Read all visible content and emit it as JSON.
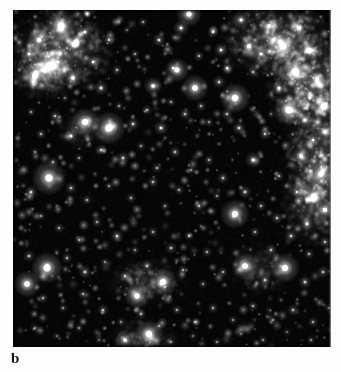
{
  "figure": {
    "panel_label": "b",
    "caption_text": "",
    "image_kind": "darkfield-fluorescence-micrograph",
    "colors": {
      "background": "#ffffff",
      "field_background": "#050505",
      "particle_bright": "#ffffff",
      "particle_mid": "#c8c8c8",
      "particle_dim": "#6e6e6e",
      "haze": "#9a9a9a",
      "label_color": "#161616"
    },
    "field": {
      "x": 13,
      "y": 10,
      "width": 318,
      "height": 337
    }
  },
  "chart_data": {
    "type": "scatter",
    "title": "",
    "subtitle": "",
    "xlabel": "",
    "ylabel": "",
    "grid": false,
    "legend": null,
    "background": "#050505",
    "xlim": [
      0,
      318
    ],
    "ylim": [
      0,
      337
    ],
    "haze_clusters": [
      {
        "cx": 48,
        "cy": 40,
        "rx": 56,
        "ry": 44,
        "intensity": 0.42
      },
      {
        "cx": 30,
        "cy": 62,
        "rx": 34,
        "ry": 30,
        "intensity": 0.3
      },
      {
        "cx": 262,
        "cy": 30,
        "rx": 60,
        "ry": 42,
        "intensity": 0.4
      },
      {
        "cx": 300,
        "cy": 78,
        "rx": 48,
        "ry": 58,
        "intensity": 0.46
      },
      {
        "cx": 308,
        "cy": 150,
        "rx": 42,
        "ry": 60,
        "intensity": 0.4
      },
      {
        "cx": 300,
        "cy": 196,
        "rx": 34,
        "ry": 44,
        "intensity": 0.28
      },
      {
        "cx": 132,
        "cy": 272,
        "rx": 40,
        "ry": 26,
        "intensity": 0.2
      },
      {
        "cx": 246,
        "cy": 258,
        "rx": 34,
        "ry": 28,
        "intensity": 0.16
      },
      {
        "cx": 130,
        "cy": 330,
        "rx": 36,
        "ry": 24,
        "intensity": 0.18
      },
      {
        "cx": 70,
        "cy": 120,
        "rx": 30,
        "ry": 22,
        "intensity": 0.14
      }
    ],
    "points": [
      {
        "x": 48,
        "y": 16,
        "r": 5.0,
        "i": 1.0
      },
      {
        "x": 26,
        "y": 30,
        "r": 3.6,
        "i": 0.8
      },
      {
        "x": 62,
        "y": 34,
        "r": 3.2,
        "i": 0.72
      },
      {
        "x": 38,
        "y": 56,
        "r": 5.6,
        "i": 0.96
      },
      {
        "x": 22,
        "y": 66,
        "r": 4.4,
        "i": 0.88
      },
      {
        "x": 60,
        "y": 68,
        "r": 3.0,
        "i": 0.7
      },
      {
        "x": 72,
        "y": 22,
        "r": 2.4,
        "i": 0.62
      },
      {
        "x": 16,
        "y": 44,
        "r": 2.6,
        "i": 0.6
      },
      {
        "x": 80,
        "y": 52,
        "r": 2.2,
        "i": 0.55
      },
      {
        "x": 96,
        "y": 30,
        "r": 2.0,
        "i": 0.5
      },
      {
        "x": 88,
        "y": 78,
        "r": 2.4,
        "i": 0.58
      },
      {
        "x": 104,
        "y": 60,
        "r": 1.8,
        "i": 0.46
      },
      {
        "x": 122,
        "y": 44,
        "r": 1.6,
        "i": 0.42
      },
      {
        "x": 130,
        "y": 12,
        "r": 1.6,
        "i": 0.4
      },
      {
        "x": 146,
        "y": 30,
        "r": 2.2,
        "i": 0.56
      },
      {
        "x": 140,
        "y": 76,
        "r": 3.0,
        "i": 0.74
      },
      {
        "x": 160,
        "y": 58,
        "r": 1.8,
        "i": 0.46
      },
      {
        "x": 168,
        "y": 18,
        "r": 2.6,
        "i": 0.64
      },
      {
        "x": 176,
        "y": 4,
        "r": 4.2,
        "i": 0.9
      },
      {
        "x": 186,
        "y": 46,
        "r": 1.8,
        "i": 0.44
      },
      {
        "x": 164,
        "y": 60,
        "r": 4.0,
        "i": 0.86
      },
      {
        "x": 182,
        "y": 78,
        "r": 4.4,
        "i": 0.92
      },
      {
        "x": 200,
        "y": 22,
        "r": 2.0,
        "i": 0.5
      },
      {
        "x": 208,
        "y": 40,
        "r": 2.4,
        "i": 0.58
      },
      {
        "x": 214,
        "y": 58,
        "r": 2.0,
        "i": 0.48
      },
      {
        "x": 228,
        "y": 10,
        "r": 2.8,
        "i": 0.66
      },
      {
        "x": 236,
        "y": 36,
        "r": 3.2,
        "i": 0.76
      },
      {
        "x": 206,
        "y": 72,
        "r": 2.2,
        "i": 0.52
      },
      {
        "x": 222,
        "y": 88,
        "r": 5.0,
        "i": 0.96
      },
      {
        "x": 240,
        "y": 62,
        "r": 1.8,
        "i": 0.46
      },
      {
        "x": 256,
        "y": 16,
        "r": 3.0,
        "i": 0.72
      },
      {
        "x": 248,
        "y": 44,
        "r": 2.6,
        "i": 0.64
      },
      {
        "x": 270,
        "y": 36,
        "r": 5.2,
        "i": 0.98
      },
      {
        "x": 286,
        "y": 18,
        "r": 3.0,
        "i": 0.76
      },
      {
        "x": 296,
        "y": 40,
        "r": 3.4,
        "i": 0.8
      },
      {
        "x": 282,
        "y": 62,
        "r": 5.4,
        "i": 0.98
      },
      {
        "x": 304,
        "y": 70,
        "r": 3.0,
        "i": 0.74
      },
      {
        "x": 266,
        "y": 78,
        "r": 2.4,
        "i": 0.58
      },
      {
        "x": 310,
        "y": 96,
        "r": 3.4,
        "i": 0.8
      },
      {
        "x": 292,
        "y": 110,
        "r": 2.6,
        "i": 0.64
      },
      {
        "x": 276,
        "y": 100,
        "r": 5.0,
        "i": 0.94
      },
      {
        "x": 300,
        "y": 130,
        "r": 2.2,
        "i": 0.54
      },
      {
        "x": 312,
        "y": 122,
        "r": 2.8,
        "i": 0.7
      },
      {
        "x": 288,
        "y": 146,
        "r": 3.0,
        "i": 0.72
      },
      {
        "x": 308,
        "y": 164,
        "r": 4.0,
        "i": 0.86
      },
      {
        "x": 300,
        "y": 186,
        "r": 3.2,
        "i": 0.76
      },
      {
        "x": 312,
        "y": 200,
        "r": 3.4,
        "i": 0.78
      },
      {
        "x": 284,
        "y": 182,
        "r": 2.0,
        "i": 0.5
      },
      {
        "x": 294,
        "y": 214,
        "r": 2.2,
        "i": 0.52
      },
      {
        "x": 266,
        "y": 166,
        "r": 1.8,
        "i": 0.44
      },
      {
        "x": 252,
        "y": 124,
        "r": 2.0,
        "i": 0.5
      },
      {
        "x": 240,
        "y": 150,
        "r": 2.6,
        "i": 0.62
      },
      {
        "x": 226,
        "y": 118,
        "r": 2.2,
        "i": 0.54
      },
      {
        "x": 214,
        "y": 104,
        "r": 2.0,
        "i": 0.48
      },
      {
        "x": 196,
        "y": 112,
        "r": 1.6,
        "i": 0.4
      },
      {
        "x": 188,
        "y": 96,
        "r": 1.8,
        "i": 0.44
      },
      {
        "x": 172,
        "y": 104,
        "r": 2.0,
        "i": 0.48
      },
      {
        "x": 158,
        "y": 92,
        "r": 1.6,
        "i": 0.4
      },
      {
        "x": 148,
        "y": 118,
        "r": 2.4,
        "i": 0.58
      },
      {
        "x": 134,
        "y": 100,
        "r": 1.8,
        "i": 0.44
      },
      {
        "x": 120,
        "y": 114,
        "r": 2.2,
        "i": 0.52
      },
      {
        "x": 106,
        "y": 96,
        "r": 1.6,
        "i": 0.4
      },
      {
        "x": 96,
        "y": 118,
        "r": 5.4,
        "i": 0.98
      },
      {
        "x": 72,
        "y": 112,
        "r": 4.6,
        "i": 0.92
      },
      {
        "x": 58,
        "y": 126,
        "r": 2.2,
        "i": 0.54
      },
      {
        "x": 42,
        "y": 106,
        "r": 2.0,
        "i": 0.48
      },
      {
        "x": 28,
        "y": 124,
        "r": 1.8,
        "i": 0.44
      },
      {
        "x": 18,
        "y": 102,
        "r": 1.6,
        "i": 0.4
      },
      {
        "x": 22,
        "y": 142,
        "r": 1.6,
        "i": 0.38
      },
      {
        "x": 40,
        "y": 152,
        "r": 1.8,
        "i": 0.44
      },
      {
        "x": 66,
        "y": 148,
        "r": 1.6,
        "i": 0.38
      },
      {
        "x": 88,
        "y": 140,
        "r": 1.8,
        "i": 0.44
      },
      {
        "x": 110,
        "y": 148,
        "r": 2.2,
        "i": 0.52
      },
      {
        "x": 128,
        "y": 136,
        "r": 1.6,
        "i": 0.38
      },
      {
        "x": 144,
        "y": 158,
        "r": 1.8,
        "i": 0.42
      },
      {
        "x": 162,
        "y": 142,
        "r": 2.0,
        "i": 0.48
      },
      {
        "x": 178,
        "y": 160,
        "r": 1.6,
        "i": 0.38
      },
      {
        "x": 196,
        "y": 150,
        "r": 1.8,
        "i": 0.42
      },
      {
        "x": 210,
        "y": 168,
        "r": 2.0,
        "i": 0.48
      },
      {
        "x": 232,
        "y": 182,
        "r": 2.2,
        "i": 0.54
      },
      {
        "x": 248,
        "y": 196,
        "r": 1.8,
        "i": 0.44
      },
      {
        "x": 264,
        "y": 208,
        "r": 2.0,
        "i": 0.48
      },
      {
        "x": 36,
        "y": 168,
        "r": 5.6,
        "i": 0.98
      },
      {
        "x": 58,
        "y": 178,
        "r": 2.0,
        "i": 0.48
      },
      {
        "x": 18,
        "y": 182,
        "r": 2.2,
        "i": 0.54
      },
      {
        "x": 74,
        "y": 190,
        "r": 1.8,
        "i": 0.42
      },
      {
        "x": 96,
        "y": 176,
        "r": 1.6,
        "i": 0.38
      },
      {
        "x": 118,
        "y": 188,
        "r": 1.8,
        "i": 0.42
      },
      {
        "x": 140,
        "y": 172,
        "r": 2.0,
        "i": 0.46
      },
      {
        "x": 152,
        "y": 196,
        "r": 1.6,
        "i": 0.38
      },
      {
        "x": 166,
        "y": 180,
        "r": 1.8,
        "i": 0.42
      },
      {
        "x": 186,
        "y": 196,
        "r": 2.0,
        "i": 0.48
      },
      {
        "x": 204,
        "y": 186,
        "r": 1.6,
        "i": 0.38
      },
      {
        "x": 222,
        "y": 204,
        "r": 4.8,
        "i": 0.94
      },
      {
        "x": 242,
        "y": 222,
        "r": 1.8,
        "i": 0.44
      },
      {
        "x": 258,
        "y": 240,
        "r": 2.0,
        "i": 0.48
      },
      {
        "x": 278,
        "y": 226,
        "r": 2.2,
        "i": 0.52
      },
      {
        "x": 296,
        "y": 244,
        "r": 1.8,
        "i": 0.44
      },
      {
        "x": 312,
        "y": 232,
        "r": 2.0,
        "i": 0.48
      },
      {
        "x": 28,
        "y": 206,
        "r": 1.6,
        "i": 0.38
      },
      {
        "x": 46,
        "y": 218,
        "r": 1.8,
        "i": 0.42
      },
      {
        "x": 66,
        "y": 230,
        "r": 1.6,
        "i": 0.38
      },
      {
        "x": 84,
        "y": 212,
        "r": 1.8,
        "i": 0.42
      },
      {
        "x": 104,
        "y": 226,
        "r": 2.2,
        "i": 0.52
      },
      {
        "x": 122,
        "y": 240,
        "r": 1.6,
        "i": 0.38
      },
      {
        "x": 140,
        "y": 222,
        "r": 1.8,
        "i": 0.42
      },
      {
        "x": 158,
        "y": 238,
        "r": 2.0,
        "i": 0.46
      },
      {
        "x": 176,
        "y": 226,
        "r": 1.6,
        "i": 0.38
      },
      {
        "x": 194,
        "y": 242,
        "r": 1.8,
        "i": 0.42
      },
      {
        "x": 16,
        "y": 246,
        "r": 2.0,
        "i": 0.48
      },
      {
        "x": 34,
        "y": 258,
        "r": 5.2,
        "i": 0.98
      },
      {
        "x": 54,
        "y": 248,
        "r": 1.8,
        "i": 0.44
      },
      {
        "x": 72,
        "y": 262,
        "r": 2.2,
        "i": 0.54
      },
      {
        "x": 92,
        "y": 252,
        "r": 1.6,
        "i": 0.38
      },
      {
        "x": 112,
        "y": 266,
        "r": 1.8,
        "i": 0.42
      },
      {
        "x": 134,
        "y": 256,
        "r": 2.0,
        "i": 0.48
      },
      {
        "x": 150,
        "y": 272,
        "r": 4.6,
        "i": 0.92
      },
      {
        "x": 124,
        "y": 286,
        "r": 4.2,
        "i": 0.88
      },
      {
        "x": 170,
        "y": 260,
        "r": 1.8,
        "i": 0.42
      },
      {
        "x": 190,
        "y": 274,
        "r": 1.6,
        "i": 0.38
      },
      {
        "x": 210,
        "y": 262,
        "r": 1.8,
        "i": 0.42
      },
      {
        "x": 232,
        "y": 256,
        "r": 4.4,
        "i": 0.9
      },
      {
        "x": 252,
        "y": 270,
        "r": 2.0,
        "i": 0.48
      },
      {
        "x": 272,
        "y": 258,
        "r": 4.8,
        "i": 0.94
      },
      {
        "x": 292,
        "y": 272,
        "r": 2.2,
        "i": 0.52
      },
      {
        "x": 310,
        "y": 262,
        "r": 2.0,
        "i": 0.48
      },
      {
        "x": 14,
        "y": 274,
        "r": 4.4,
        "i": 0.92
      },
      {
        "x": 30,
        "y": 288,
        "r": 1.8,
        "i": 0.44
      },
      {
        "x": 50,
        "y": 298,
        "r": 1.6,
        "i": 0.38
      },
      {
        "x": 70,
        "y": 284,
        "r": 1.8,
        "i": 0.42
      },
      {
        "x": 90,
        "y": 300,
        "r": 2.0,
        "i": 0.46
      },
      {
        "x": 108,
        "y": 312,
        "r": 1.6,
        "i": 0.36
      },
      {
        "x": 128,
        "y": 304,
        "r": 1.8,
        "i": 0.42
      },
      {
        "x": 146,
        "y": 316,
        "r": 1.6,
        "i": 0.36
      },
      {
        "x": 164,
        "y": 300,
        "r": 1.8,
        "i": 0.42
      },
      {
        "x": 182,
        "y": 312,
        "r": 1.6,
        "i": 0.36
      },
      {
        "x": 200,
        "y": 298,
        "r": 1.8,
        "i": 0.42
      },
      {
        "x": 220,
        "y": 310,
        "r": 1.6,
        "i": 0.36
      },
      {
        "x": 240,
        "y": 296,
        "r": 1.8,
        "i": 0.42
      },
      {
        "x": 260,
        "y": 310,
        "r": 1.6,
        "i": 0.36
      },
      {
        "x": 280,
        "y": 300,
        "r": 2.0,
        "i": 0.46
      },
      {
        "x": 300,
        "y": 312,
        "r": 1.8,
        "i": 0.42
      },
      {
        "x": 316,
        "y": 298,
        "r": 1.6,
        "i": 0.36
      },
      {
        "x": 22,
        "y": 318,
        "r": 1.6,
        "i": 0.36
      },
      {
        "x": 44,
        "y": 326,
        "r": 1.4,
        "i": 0.32
      },
      {
        "x": 66,
        "y": 318,
        "r": 1.6,
        "i": 0.36
      },
      {
        "x": 86,
        "y": 330,
        "r": 1.4,
        "i": 0.32
      },
      {
        "x": 112,
        "y": 330,
        "r": 3.2,
        "i": 0.72
      },
      {
        "x": 136,
        "y": 324,
        "r": 4.6,
        "i": 0.92
      },
      {
        "x": 158,
        "y": 332,
        "r": 1.6,
        "i": 0.36
      },
      {
        "x": 180,
        "y": 326,
        "r": 1.4,
        "i": 0.32
      },
      {
        "x": 204,
        "y": 332,
        "r": 1.6,
        "i": 0.36
      },
      {
        "x": 228,
        "y": 324,
        "r": 1.4,
        "i": 0.32
      },
      {
        "x": 250,
        "y": 330,
        "r": 1.6,
        "i": 0.36
      },
      {
        "x": 274,
        "y": 322,
        "r": 1.4,
        "i": 0.32
      },
      {
        "x": 298,
        "y": 330,
        "r": 1.6,
        "i": 0.36
      },
      {
        "x": 318,
        "y": 320,
        "r": 1.4,
        "i": 0.32
      },
      {
        "x": 52,
        "y": 88,
        "r": 1.4,
        "i": 0.34
      },
      {
        "x": 114,
        "y": 20,
        "r": 1.4,
        "i": 0.32
      },
      {
        "x": 152,
        "y": 128,
        "r": 1.2,
        "i": 0.3
      },
      {
        "x": 206,
        "y": 134,
        "r": 1.2,
        "i": 0.3
      },
      {
        "x": 258,
        "y": 104,
        "r": 1.4,
        "i": 0.34
      },
      {
        "x": 82,
        "y": 164,
        "r": 1.2,
        "i": 0.3
      },
      {
        "x": 44,
        "y": 196,
        "r": 1.2,
        "i": 0.28
      },
      {
        "x": 188,
        "y": 216,
        "r": 1.2,
        "i": 0.28
      },
      {
        "x": 268,
        "y": 290,
        "r": 1.2,
        "i": 0.28
      },
      {
        "x": 152,
        "y": 44,
        "r": 1.2,
        "i": 0.3
      }
    ]
  }
}
